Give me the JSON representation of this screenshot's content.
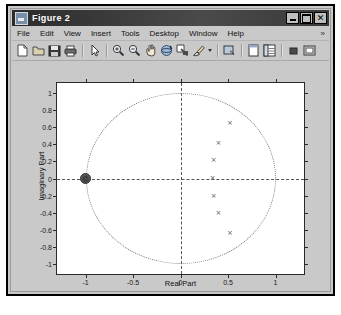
{
  "window": {
    "title": "Figure 2",
    "icon": "matlab-figure-icon",
    "buttons": {
      "minimize_label": "_",
      "maximize_label": "❐",
      "close_label": "✕"
    }
  },
  "menubar": {
    "items": [
      {
        "label": "File"
      },
      {
        "label": "Edit"
      },
      {
        "label": "View"
      },
      {
        "label": "Insert"
      },
      {
        "label": "Tools"
      },
      {
        "label": "Desktop"
      },
      {
        "label": "Window"
      },
      {
        "label": "Help"
      }
    ],
    "overflow_label": "»"
  },
  "toolbar": {
    "items": [
      {
        "name": "new-figure-icon"
      },
      {
        "name": "open-file-icon"
      },
      {
        "name": "save-figure-icon"
      },
      {
        "name": "print-figure-icon"
      },
      {
        "name": "edit-plot-arrow-icon"
      },
      {
        "name": "zoom-in-icon"
      },
      {
        "name": "zoom-out-icon"
      },
      {
        "name": "pan-hand-icon"
      },
      {
        "name": "rotate-3d-icon"
      },
      {
        "name": "data-cursor-icon"
      },
      {
        "name": "brush-select-icon"
      },
      {
        "name": "brush-dropdown-icon"
      },
      {
        "name": "link-plot-icon"
      },
      {
        "name": "plot-browser-icon"
      },
      {
        "name": "property-editor-icon"
      },
      {
        "name": "figure-palette-icon"
      },
      {
        "name": "insert-colorbar-icon"
      }
    ]
  },
  "chart_data": {
    "type": "scatter",
    "title": "",
    "xlabel": "Real Part",
    "ylabel": "Imaginary Part",
    "xlim": [
      -1.3,
      1.3
    ],
    "ylim": [
      -1.12,
      1.12
    ],
    "xticks": [
      -1,
      -0.5,
      0,
      0.5,
      1
    ],
    "xticklabels": [
      "-1",
      "-0.5",
      "0",
      "0.5",
      "1"
    ],
    "yticks": [
      1,
      0.8,
      0.6,
      0.4,
      0.2,
      0,
      -0.2,
      -0.4,
      -0.6,
      -0.8,
      -1
    ],
    "yticklabels": [
      "1",
      "0.8",
      "0.6",
      "0.4",
      "0.2",
      "0",
      "-0.2",
      "-0.4",
      "-0.6",
      "-0.8",
      "-1"
    ],
    "grid": false,
    "legend": null,
    "annotations": [
      {
        "name": "unit-circle",
        "kind": "circle",
        "center": [
          0,
          0
        ],
        "radius": 1,
        "style": "dotted"
      },
      {
        "name": "real-axis-line",
        "kind": "hline",
        "y": 0,
        "style": "dashed"
      },
      {
        "name": "imag-axis-line",
        "kind": "vline",
        "x": 0,
        "style": "dashed"
      }
    ],
    "series": [
      {
        "name": "Zeros",
        "marker": "x",
        "points": [
          {
            "x": 0.52,
            "y": 0.65
          },
          {
            "x": 0.4,
            "y": 0.41
          },
          {
            "x": 0.35,
            "y": 0.21
          },
          {
            "x": 0.34,
            "y": 0.0
          },
          {
            "x": 0.35,
            "y": -0.21
          },
          {
            "x": 0.4,
            "y": -0.41
          },
          {
            "x": 0.52,
            "y": -0.65
          }
        ]
      },
      {
        "name": "Poles",
        "marker": "x-cluster",
        "points": [
          {
            "x": -1.0,
            "y": 0.0
          }
        ],
        "multiplicity": 7
      }
    ]
  }
}
